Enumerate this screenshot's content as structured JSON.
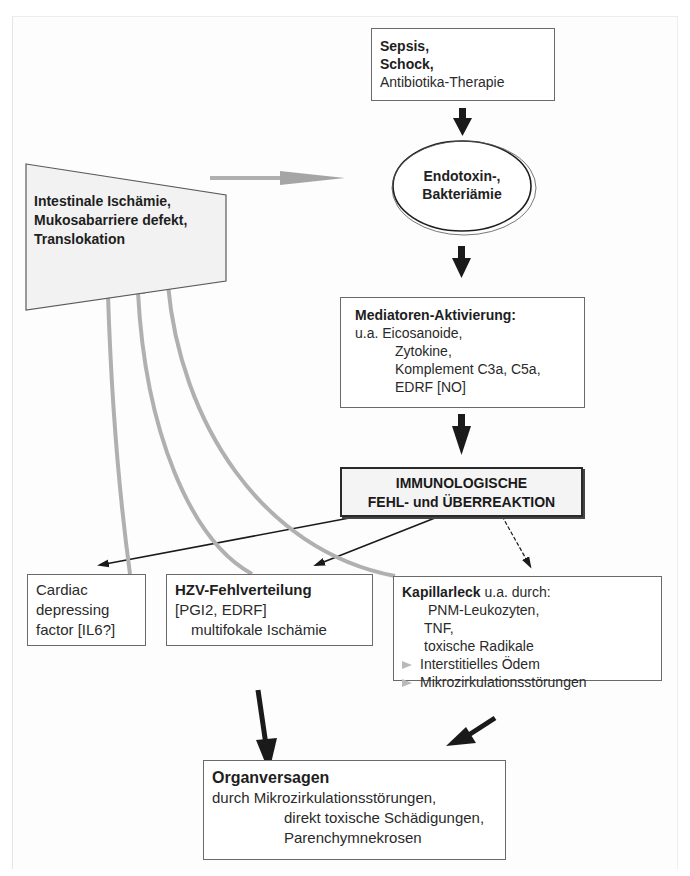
{
  "diagram": {
    "colors": {
      "arrow_dark": "#1a1a1a",
      "arrow_gray": "#a8a8a8",
      "box_border": "#6a6a6a",
      "trapezoid_fill": "#f2f2f2",
      "immuno_fill": "#f4f4f4"
    },
    "nodes": {
      "sepsis": {
        "lines": [
          "Sepsis,",
          "Schock,",
          "Antibiotika-Therapie"
        ]
      },
      "endotoxin": {
        "lines": [
          "Endotoxin-,",
          "Bakteriämie"
        ]
      },
      "intestinal": {
        "lines": [
          "Intestinale Ischämie,",
          "Mukosabarriere defekt,",
          "Translokation"
        ]
      },
      "mediatoren": {
        "title": "Mediatoren-Aktivierung:",
        "lines": [
          "u.a. Eicosanoide,",
          "Zytokine,",
          "Komplement C3a, C5a,",
          "EDRF [NO]"
        ]
      },
      "immuno": {
        "lines": [
          "IMMUNOLOGISCHE",
          "FEHL- und ÜBERREAKTION"
        ]
      },
      "cardiac": {
        "lines": [
          "Cardiac",
          "depressing",
          "factor [IL6?]"
        ]
      },
      "hzv": {
        "title": "HZV-Fehlverteilung",
        "lines": [
          "[PGI2, EDRF]",
          "multifokale Ischämie"
        ]
      },
      "kapillar": {
        "title": "Kapillarleck",
        "title_suffix": " u.a. durch:",
        "lines": [
          "PNM-Leukozyten,",
          "TNF,",
          "toxische Radikale"
        ],
        "bullets": [
          "Interstitielles Ödem",
          "Mikrozirkulationsstörungen"
        ]
      },
      "organ": {
        "title": "Organversagen",
        "lines": [
          "durch Mikrozirkulationsstörungen,",
          "direkt toxische Schädigungen,",
          "Parenchymnekrosen"
        ]
      }
    },
    "edges": [
      {
        "from": "sepsis",
        "to": "endotoxin",
        "style": "dark"
      },
      {
        "from": "intestinal",
        "to": "endotoxin",
        "style": "gray"
      },
      {
        "from": "endotoxin",
        "to": "mediatoren",
        "style": "dark"
      },
      {
        "from": "mediatoren",
        "to": "immuno",
        "style": "dark"
      },
      {
        "from": "immuno",
        "to": "cardiac",
        "style": "thin-dark"
      },
      {
        "from": "immuno",
        "to": "hzv",
        "style": "thin-dark"
      },
      {
        "from": "immuno",
        "to": "kapillar",
        "style": "thin-dark"
      },
      {
        "from": "cardiac",
        "to": "intestinal",
        "style": "gray-curved"
      },
      {
        "from": "hzv",
        "to": "intestinal",
        "style": "gray-curved"
      },
      {
        "from": "kapillar",
        "to": "intestinal",
        "style": "gray-curved"
      },
      {
        "from": "hzv",
        "to": "organ",
        "style": "dark"
      },
      {
        "from": "kapillar",
        "to": "organ",
        "style": "dark"
      }
    ]
  }
}
